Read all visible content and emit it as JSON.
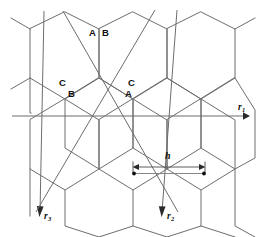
{
  "figure": {
    "background_color": "#ffffff",
    "lattice_stroke_color": "#6d6d6d",
    "axis_stroke_color": "#6d6d6d",
    "label_color": "#111111",
    "width": 260,
    "height": 237
  },
  "site_labels": [
    {
      "id": "site-a-top",
      "text": "A",
      "x": 92,
      "y": 33
    },
    {
      "id": "site-b-top",
      "text": "B",
      "x": 104,
      "y": 33
    },
    {
      "id": "site-c-left",
      "text": "C",
      "x": 62,
      "y": 83
    },
    {
      "id": "site-b-left",
      "text": "B",
      "x": 71,
      "y": 93
    },
    {
      "id": "site-c-right",
      "text": "C",
      "x": 131,
      "y": 83
    },
    {
      "id": "site-a-right",
      "text": "A",
      "x": 128,
      "y": 93
    }
  ],
  "axes": [
    {
      "id": "axis-r1",
      "name": "r1",
      "label": "r",
      "subscript": "1",
      "label_x": 239,
      "label_y": 108,
      "from": {
        "x": 12,
        "y": 116
      },
      "to": {
        "x": 246,
        "y": 116
      },
      "direction": "horizontal-right"
    },
    {
      "id": "axis-r2",
      "name": "r2",
      "label": "r",
      "subscript": "2",
      "label_x": 167,
      "label_y": 218,
      "from": {
        "x": 155,
        "y": 10
      },
      "to": {
        "x": 163,
        "y": 216
      },
      "direction": "down-left"
    },
    {
      "id": "axis-r3",
      "name": "r3",
      "label": "r",
      "subscript": "3",
      "label_x": 44,
      "label_y": 218,
      "from": {
        "x": 41,
        "y": 12
      },
      "to": {
        "x": 40,
        "y": 216
      },
      "direction": "down-left"
    }
  ],
  "dimension": {
    "id": "dimension-h",
    "label": "h",
    "label_x": 166,
    "label_y": 156,
    "arrow_y": 167,
    "x_start": 133,
    "x_end": 205,
    "pair_line_y": 173,
    "dot_left_x": 134,
    "dot_right_x": 204
  },
  "lattice": {
    "hex_radius": 34,
    "rows": 3,
    "columns": 3,
    "description": "honeycomb tiling of flat-topped hexagons"
  }
}
